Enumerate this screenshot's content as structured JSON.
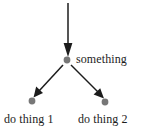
{
  "diagram": {
    "type": "flow-tree",
    "background_color": "#ffffff",
    "width": 143,
    "height": 135,
    "node_color": "#777777",
    "edge_color": "#1c1c1c",
    "text_color": "#1c1c1c",
    "nodes": [
      {
        "id": "something",
        "label": "something",
        "x": 67,
        "y": 60,
        "radius": 3.4,
        "label_position": "right"
      },
      {
        "id": "do-thing-1",
        "label": "do thing 1",
        "x": 32,
        "y": 101,
        "radius": 3.4,
        "label_position": "below"
      },
      {
        "id": "do-thing-2",
        "label": "do thing 2",
        "x": 105,
        "y": 102,
        "radius": 3.4,
        "label_position": "below"
      }
    ],
    "edges": [
      {
        "id": "entry-arrow",
        "from": "top",
        "to": "something",
        "x1": 68,
        "y1": 3,
        "x2": 67,
        "y2": 55,
        "arrowhead": true
      },
      {
        "id": "something-to-do-thing-1",
        "from": "something",
        "to": "do-thing-1",
        "x1": 63,
        "y1": 65,
        "x2": 34,
        "y2": 96,
        "arrowhead": true
      },
      {
        "id": "something-to-do-thing-2",
        "from": "something",
        "to": "do-thing-2",
        "x1": 71,
        "y1": 65,
        "x2": 103,
        "y2": 97,
        "arrowhead": true
      }
    ]
  }
}
